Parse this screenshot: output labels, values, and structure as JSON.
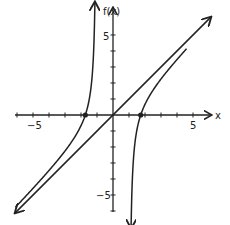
{
  "chart_data": {
    "type": "line",
    "title": "",
    "xlabel": "x",
    "ylabel": "f(x)",
    "xlim": [
      -6.2,
      6.2
    ],
    "ylim": [
      -6,
      6.5
    ],
    "x_ticks": [
      -6,
      -5,
      -4,
      -3,
      -2,
      -1,
      1,
      2,
      3,
      4,
      5
    ],
    "y_ticks": [
      -6,
      -5,
      -4,
      -3,
      -2,
      -1,
      1,
      2,
      3,
      4,
      5
    ],
    "tick_labels": {
      "x": [
        "-5",
        "5"
      ],
      "y": [
        "5",
        "-5"
      ]
    },
    "grid": false,
    "legend": null,
    "series": [
      {
        "name": "f(x)",
        "description": "rational function with vertical asymptotes near x = -1 and x = 1 and slant asymptote y = x",
        "formula": "x + 2x/(1 - x^2)"
      },
      {
        "name": "slant asymptote",
        "formula": "y = x"
      }
    ],
    "x_intercepts": [
      -1.73,
      0,
      1.73
    ],
    "marked_points": [
      {
        "x": -1.73,
        "y": 0
      },
      {
        "x": 1.73,
        "y": 0
      }
    ]
  },
  "labels": {
    "x_axis": "x",
    "y_axis": "f(x)",
    "x_neg5": "−5",
    "x_pos5": "5",
    "y_pos5": "5",
    "y_neg5": "−5"
  }
}
